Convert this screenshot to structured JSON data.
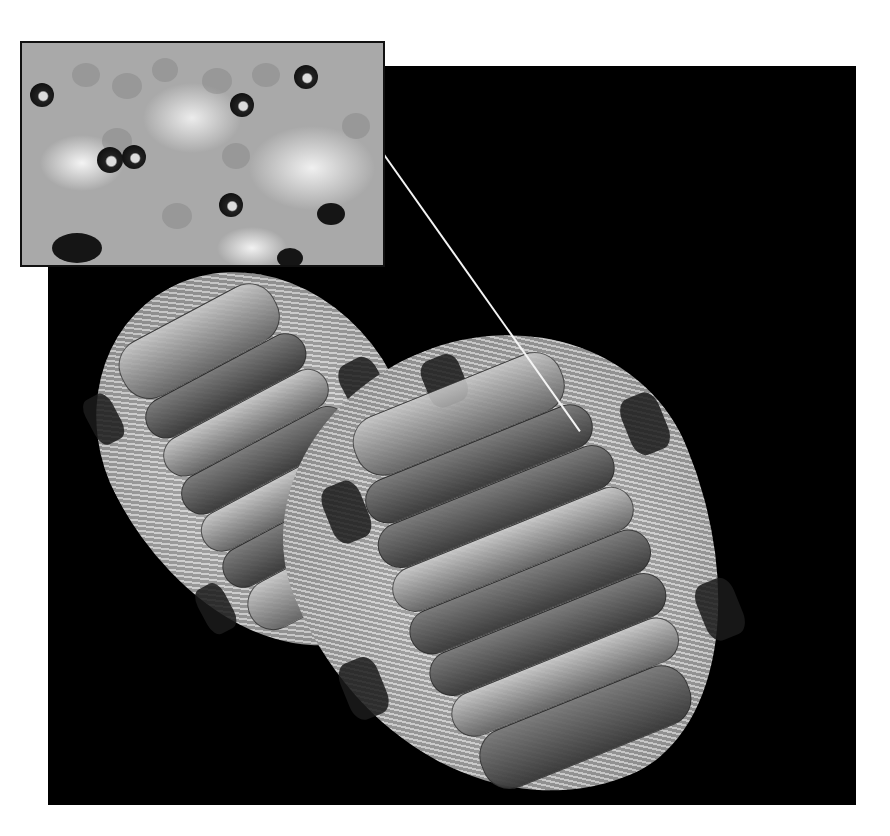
{
  "figure": {
    "inset": {
      "label": "magnified surface detail",
      "features": [
        "cellular granules",
        "dark ocelli / pores",
        "pale domed regions"
      ]
    },
    "specimens": [
      {
        "name": "chiton-left",
        "plates": 8
      },
      {
        "name": "chiton-right",
        "plates": 8
      }
    ],
    "colors": {
      "background": "#000000",
      "page": "#ffffff",
      "leader_line": "#f4f4f4",
      "girdle": "#bdbdbd",
      "inset_base": "#a9a9a9"
    }
  }
}
